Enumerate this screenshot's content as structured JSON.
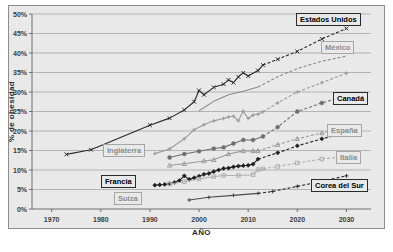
{
  "chart_data": {
    "type": "line",
    "title": "",
    "xlabel": "AÑO",
    "ylabel": "% de obesidad",
    "xlim": [
      1966,
      2035
    ],
    "ylim": [
      0,
      50
    ],
    "xticks": [
      1970,
      1980,
      1990,
      2000,
      2010,
      2020,
      2030
    ],
    "yticks": [
      0,
      5,
      10,
      15,
      20,
      25,
      30,
      35,
      40,
      45,
      50
    ],
    "ytick_labels": [
      "0%",
      "5%",
      "10%",
      "15%",
      "20%",
      "25%",
      "30%",
      "35%",
      "40%",
      "45%",
      "50%"
    ],
    "xtick_labels": [
      "1970",
      "1980",
      "1990",
      "2000",
      "2010",
      "2020",
      "2030"
    ],
    "grid": "horizontal",
    "legend_position": "inline-labels",
    "background_color": "#e9e9e9",
    "series": [
      {
        "name": "Estados Unidos",
        "label_style": "dark",
        "color": "#2b2b2b",
        "marker": "x",
        "observed": [
          [
            1973,
            14.0
          ],
          [
            1978,
            15.2
          ],
          [
            1990,
            21.5
          ],
          [
            1994,
            23.3
          ],
          [
            1997,
            25.4
          ],
          [
            1999,
            27.5
          ],
          [
            2000,
            30.4
          ],
          [
            2001,
            29.3
          ],
          [
            2003,
            31.2
          ],
          [
            2005,
            32.0
          ],
          [
            2006,
            33.1
          ],
          [
            2007,
            32.4
          ],
          [
            2008,
            33.9
          ],
          [
            2009,
            34.9
          ],
          [
            2010,
            34.1
          ],
          [
            2012,
            35.5
          ],
          [
            2013,
            36.9
          ]
        ],
        "projected": [
          [
            2013,
            36.9
          ],
          [
            2016,
            38.4
          ],
          [
            2020,
            40.4
          ],
          [
            2025,
            43.6
          ],
          [
            2030,
            46.3
          ]
        ]
      },
      {
        "name": "México",
        "label_style": "gray",
        "color": "#8a8a8a",
        "marker": "none",
        "observed": [
          [
            2000,
            25.2
          ],
          [
            2003,
            27.6
          ],
          [
            2006,
            29.3
          ],
          [
            2009,
            30.2
          ],
          [
            2012,
            31.3
          ]
        ],
        "projected": [
          [
            2012,
            31.3
          ],
          [
            2016,
            33.9
          ],
          [
            2020,
            36.0
          ],
          [
            2025,
            37.9
          ],
          [
            2030,
            39.2
          ]
        ]
      },
      {
        "name": "Canadá",
        "label_style": "dark",
        "color": "#6e6e6e",
        "marker": "circle",
        "observed": [
          [
            1994,
            13.2
          ],
          [
            1997,
            14.1
          ],
          [
            2000,
            14.8
          ],
          [
            2003,
            15.5
          ],
          [
            2005,
            15.8
          ],
          [
            2007,
            16.8
          ],
          [
            2009,
            17.7
          ],
          [
            2011,
            17.7
          ],
          [
            2013,
            18.6
          ]
        ],
        "projected": [
          [
            2013,
            18.6
          ],
          [
            2016,
            21.0
          ],
          [
            2020,
            25.0
          ],
          [
            2025,
            27.2
          ],
          [
            2030,
            29.0
          ]
        ]
      },
      {
        "name": "Inglaterra",
        "label_style": "gray",
        "color": "#9a9a9a",
        "marker": "plus",
        "observed": [
          [
            1991,
            14.2
          ],
          [
            1994,
            15.4
          ],
          [
            1997,
            18.0
          ],
          [
            1999,
            20.3
          ],
          [
            2001,
            21.6
          ],
          [
            2003,
            22.6
          ],
          [
            2005,
            23.2
          ],
          [
            2006,
            23.6
          ],
          [
            2007,
            23.8
          ],
          [
            2008,
            22.6
          ],
          [
            2009,
            25.1
          ],
          [
            2010,
            23.2
          ],
          [
            2011,
            24.1
          ],
          [
            2012,
            24.3
          ],
          [
            2013,
            24.9
          ]
        ],
        "projected": [
          [
            2013,
            24.9
          ],
          [
            2016,
            27.2
          ],
          [
            2020,
            30.0
          ],
          [
            2025,
            32.4
          ],
          [
            2030,
            34.8
          ]
        ]
      },
      {
        "name": "España",
        "label_style": "gray",
        "color": "#9a9a9a",
        "marker": "triangle",
        "observed": [
          [
            1994,
            11.2
          ],
          [
            1997,
            11.6
          ],
          [
            2001,
            12.3
          ],
          [
            2003,
            12.6
          ],
          [
            2006,
            14.1
          ],
          [
            2009,
            14.9
          ],
          [
            2011,
            14.9
          ],
          [
            2012,
            14.9
          ]
        ],
        "projected": [
          [
            2012,
            14.9
          ],
          [
            2016,
            16.5
          ],
          [
            2020,
            18.0
          ],
          [
            2025,
            19.5
          ],
          [
            2030,
            21.0
          ]
        ]
      },
      {
        "name": "Francia",
        "label_style": "dark",
        "color": "#1f1f1f",
        "marker": "diamond",
        "observed": [
          [
            1991,
            6.1
          ],
          [
            1992,
            6.2
          ],
          [
            1993,
            6.3
          ],
          [
            1994,
            6.5
          ],
          [
            1995,
            6.8
          ],
          [
            1996,
            7.3
          ],
          [
            1997,
            8.5
          ],
          [
            1998,
            7.6
          ],
          [
            1999,
            8.0
          ],
          [
            2000,
            8.4
          ],
          [
            2001,
            8.9
          ],
          [
            2002,
            9.1
          ],
          [
            2003,
            9.6
          ],
          [
            2004,
            10.0
          ],
          [
            2005,
            10.4
          ],
          [
            2006,
            10.5
          ],
          [
            2007,
            10.8
          ],
          [
            2008,
            11.0
          ],
          [
            2009,
            11.1
          ],
          [
            2010,
            11.2
          ],
          [
            2011,
            11.5
          ],
          [
            2012,
            12.8
          ]
        ],
        "projected": [
          [
            2012,
            12.8
          ],
          [
            2016,
            14.4
          ],
          [
            2020,
            16.2
          ],
          [
            2025,
            18.0
          ],
          [
            2030,
            19.5
          ]
        ]
      },
      {
        "name": "Italia",
        "label_style": "gray",
        "color": "#b0b0b0",
        "marker": "square",
        "observed": [
          [
            1994,
            6.4
          ],
          [
            1997,
            7.0
          ],
          [
            2000,
            7.7
          ],
          [
            2003,
            8.3
          ],
          [
            2005,
            8.6
          ],
          [
            2008,
            8.6
          ],
          [
            2011,
            8.8
          ],
          [
            2012,
            10.1
          ],
          [
            2013,
            10.3
          ]
        ],
        "projected": [
          [
            2013,
            10.3
          ],
          [
            2016,
            10.9
          ],
          [
            2020,
            11.8
          ],
          [
            2025,
            12.8
          ],
          [
            2030,
            13.5
          ]
        ]
      },
      {
        "name": "Suiza",
        "label_style": "gray",
        "color": "#4a4a4a",
        "marker": "plus",
        "observed": [
          [
            1998,
            2.3
          ],
          [
            2002,
            3.0
          ],
          [
            2007,
            3.5
          ],
          [
            2012,
            4.0
          ]
        ],
        "projected": []
      },
      {
        "name": "Corea del Sur",
        "label_style": "dark",
        "color": "#2b2b2b",
        "marker": "plus",
        "observed": [],
        "projected": [
          [
            2012,
            4.0
          ],
          [
            2015,
            4.5
          ],
          [
            2020,
            5.8
          ],
          [
            2025,
            7.1
          ],
          [
            2030,
            8.5
          ]
        ]
      }
    ],
    "annotations": [
      {
        "text": "Estados Unidos",
        "style": "dark",
        "x": 296,
        "y": 13
      },
      {
        "text": "México",
        "style": "gray",
        "x": 321,
        "y": 41
      },
      {
        "text": "Canadá",
        "style": "dark",
        "x": 333,
        "y": 92
      },
      {
        "text": "España",
        "style": "gray",
        "x": 327,
        "y": 124
      },
      {
        "text": "Italia",
        "style": "gray",
        "x": 336,
        "y": 151
      },
      {
        "text": "Corea del Sur",
        "style": "dark",
        "x": 311,
        "y": 179
      },
      {
        "text": "Inglaterra",
        "style": "gray",
        "x": 103,
        "y": 144
      },
      {
        "text": "Francia",
        "style": "dark",
        "x": 101,
        "y": 175
      },
      {
        "text": "Suiza",
        "style": "gray",
        "x": 114,
        "y": 192
      }
    ]
  }
}
